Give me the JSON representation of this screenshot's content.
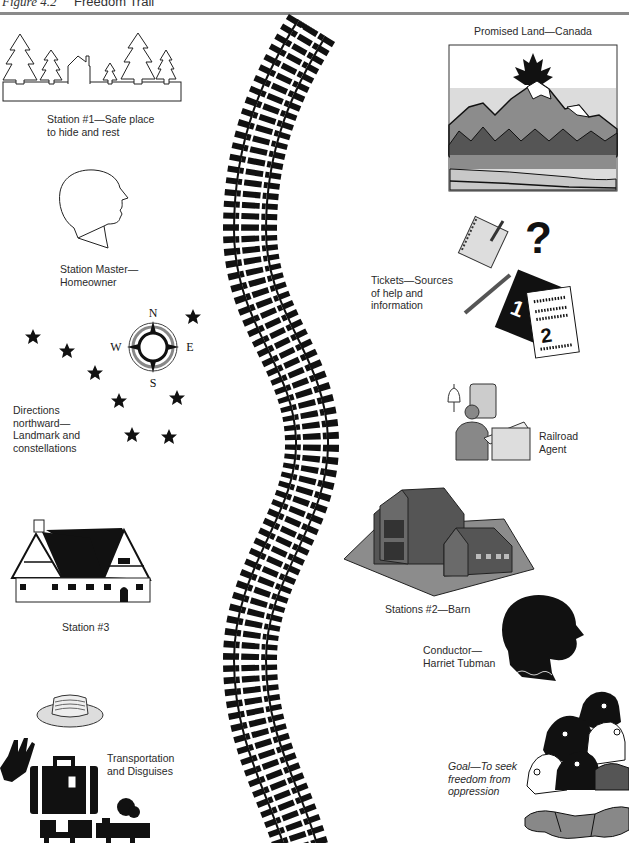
{
  "header": {
    "figure_number": "Figure 4.2",
    "title": "Freedom Trail"
  },
  "items": {
    "station1": {
      "line1": "Station #1—Safe place",
      "line2": "to hide and rest",
      "icon": "trees-and-house"
    },
    "station_master": {
      "line1": "Station Master—",
      "line2": "Homeowner",
      "icon": "head-outline"
    },
    "directions": {
      "line1": "Directions",
      "line2": "northward—",
      "line3": "Landmark and",
      "line4": "constellations",
      "icon": "compass-and-stars",
      "compass": {
        "n": "N",
        "s": "S",
        "e": "E",
        "w": "W"
      }
    },
    "station3": {
      "label": "Station #3",
      "icon": "tudor-house"
    },
    "transport": {
      "line1": "Transportation",
      "line2": "and Disguises",
      "icon": "hat-hand-suitcase-train"
    },
    "promised_land": {
      "label": "Promised Land—Canada",
      "icon": "canada-mountains"
    },
    "tickets": {
      "line1": "Tickets—Sources",
      "line2": "of help and",
      "line3": "information",
      "icon": "notebook-tickets",
      "ticket1": "1",
      "ticket2": "2",
      "question": "?"
    },
    "railroad_agent": {
      "line1": "Railroad",
      "line2": "Agent",
      "icon": "agent-at-desk"
    },
    "station2": {
      "label": "Stations #2—Barn",
      "icon": "barn"
    },
    "conductor": {
      "line1": "Conductor—",
      "line2": "Harriet Tubman",
      "icon": "head-silhouette"
    },
    "goal": {
      "line1": "Goal—To seek",
      "line2": "freedom from",
      "line3": "oppression",
      "icon": "faces-handshake"
    }
  },
  "colors": {
    "ink": "#111111",
    "rule": "#8a8a8a",
    "gray_dark": "#555555",
    "gray_mid": "#8c8c8c",
    "gray_light": "#c8c8c8"
  }
}
